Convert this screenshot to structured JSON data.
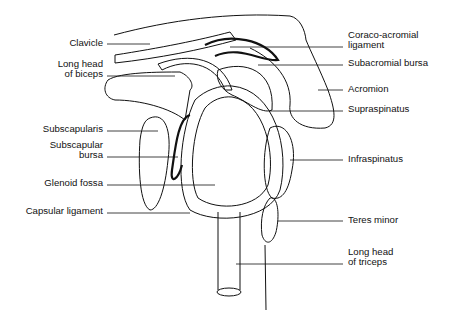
{
  "figure": {
    "type": "anatomical-diagram"
  },
  "labels_left": [
    {
      "id": "clavicle",
      "lines": [
        "Clavicle"
      ]
    },
    {
      "id": "long-head-biceps",
      "lines": [
        "Long head",
        "of biceps"
      ]
    },
    {
      "id": "subscapularis",
      "lines": [
        "Subscapularis"
      ]
    },
    {
      "id": "subscapular-bursa",
      "lines": [
        "Subscapular",
        "bursa"
      ]
    },
    {
      "id": "glenoid-fossa",
      "lines": [
        "Glenoid fossa"
      ]
    },
    {
      "id": "capsular-ligament",
      "lines": [
        "Capsular ligament"
      ]
    }
  ],
  "labels_right": [
    {
      "id": "coraco-acromial-ligament",
      "lines": [
        "Coraco-acromial",
        "ligament"
      ]
    },
    {
      "id": "subacromial-bursa",
      "lines": [
        "Subacromial bursa"
      ]
    },
    {
      "id": "acromion",
      "lines": [
        "Acromion"
      ]
    },
    {
      "id": "supraspinatus",
      "lines": [
        "Supraspinatus"
      ]
    },
    {
      "id": "infraspinatus",
      "lines": [
        "Infraspinatus"
      ]
    },
    {
      "id": "teres-minor",
      "lines": [
        "Teres minor"
      ]
    },
    {
      "id": "long-head-triceps",
      "lines": [
        "Long head",
        "of triceps"
      ]
    }
  ],
  "colors": {
    "ink": "#111111",
    "background": "#ffffff"
  }
}
